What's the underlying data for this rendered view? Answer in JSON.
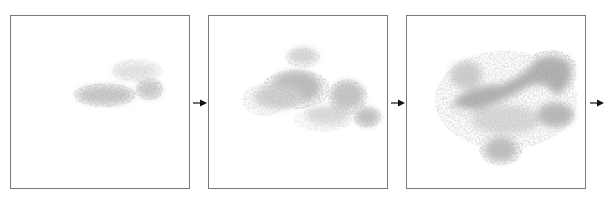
{
  "figure": {
    "panels": [
      {
        "label": "stage-1",
        "description": "sparse gray cloud, small horseshoe shape upper-center"
      },
      {
        "label": "stage-2",
        "description": "larger gray cloud spreading"
      },
      {
        "label": "stage-3",
        "description": "dense gray cloud filling most of panel"
      }
    ],
    "arrows": [
      "arrow-1",
      "arrow-2",
      "arrow-3"
    ],
    "colors": {
      "border": "#7a7a7a",
      "cloud": "#8c8c8c",
      "arrow": "#111111",
      "background": "#ffffff"
    }
  }
}
